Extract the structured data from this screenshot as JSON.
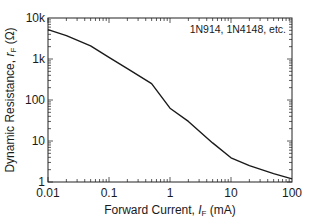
{
  "chart_data": {
    "type": "line",
    "title": "",
    "xlabel": "Forward Current, I_F (mA)",
    "xlabel_parts": {
      "prefix": "Forward Current, ",
      "var": "I",
      "sub": "F",
      "suffix": " (mA)"
    },
    "ylabel": "Dynamic Resistance, r_F (Ω)",
    "ylabel_parts": {
      "prefix": "Dynamic Resistance, ",
      "var": "r",
      "sub": "F",
      "suffix": " (Ω)"
    },
    "xscale": "log",
    "yscale": "log",
    "xlim": [
      0.01,
      100
    ],
    "ylim": [
      1,
      10000
    ],
    "x_ticks": [
      "0.01",
      "0.1",
      "1",
      "10",
      "100"
    ],
    "y_ticks": [
      "1",
      "10",
      "100",
      "1k",
      "10k"
    ],
    "grid": false,
    "legend_position": "top-right",
    "annotation": "1N914, 1N4148, etc.",
    "note": "Values read off the plotted curve from pixel positions; mid-range readings are approximate and were not fully reconciled.",
    "series": [
      {
        "name": "1N914, 1N4148, etc.",
        "x": [
          0.01,
          0.02,
          0.05,
          0.1,
          0.2,
          0.5,
          1,
          2,
          5,
          10,
          20,
          50,
          100
        ],
        "y": [
          5200,
          3700,
          2100,
          1100,
          580,
          250,
          63,
          30,
          9,
          3.9,
          2.5,
          1.6,
          1.2
        ]
      }
    ]
  }
}
